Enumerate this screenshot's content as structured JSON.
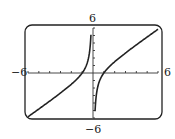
{
  "chart_data": {
    "type": "line",
    "title": "",
    "xlabel": "",
    "ylabel": "",
    "xlim": [
      -6,
      6
    ],
    "ylim": [
      -6,
      6
    ],
    "xscale_ticks": 1,
    "yscale_ticks": 1,
    "grid": false,
    "function": "y = x - 1/x",
    "vertical_asymptote": 0,
    "x_intercepts": [
      -1,
      1
    ],
    "series": [
      {
        "name": "left branch",
        "x": [
          -6,
          -5,
          -4,
          -3,
          -2,
          -1,
          -0.5,
          -0.2,
          -0.17
        ],
        "y": [
          -5.83,
          -4.8,
          -3.75,
          -2.67,
          -1.5,
          0,
          1.5,
          4.8,
          5.7
        ]
      },
      {
        "name": "right branch",
        "x": [
          0.17,
          0.2,
          0.5,
          1,
          2,
          3,
          4,
          5,
          6
        ],
        "y": [
          -5.7,
          -4.8,
          -1.5,
          0,
          1.5,
          2.67,
          3.75,
          4.8,
          5.83
        ]
      }
    ]
  },
  "labels": {
    "xmin": "−6",
    "xmax": "6",
    "ymin": "−6",
    "ymax": "6"
  }
}
